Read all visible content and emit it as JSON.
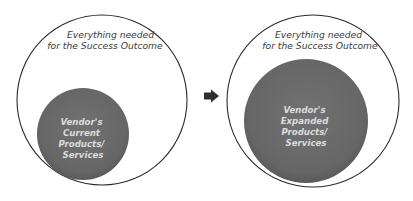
{
  "diagram": {
    "before": {
      "outer_label": [
        "Everything needed",
        "for the Success Outcome"
      ],
      "inner_label": [
        "Vendor's",
        "Current",
        "Products/",
        "Services"
      ]
    },
    "arrow": {
      "icon": "right-arrow-icon"
    },
    "after": {
      "outer_label": [
        "Everything needed",
        "for the Success Outcome"
      ],
      "inner_label": [
        "Vendor's",
        "Expanded",
        "Products/",
        "Services"
      ]
    },
    "colors": {
      "outer_stroke": "#2a2a2a",
      "inner_fill": "#6b6b6b",
      "inner_text": "#dcdcdc",
      "outer_text": "#3a3a3a",
      "arrow": "#2e2e2e"
    }
  }
}
